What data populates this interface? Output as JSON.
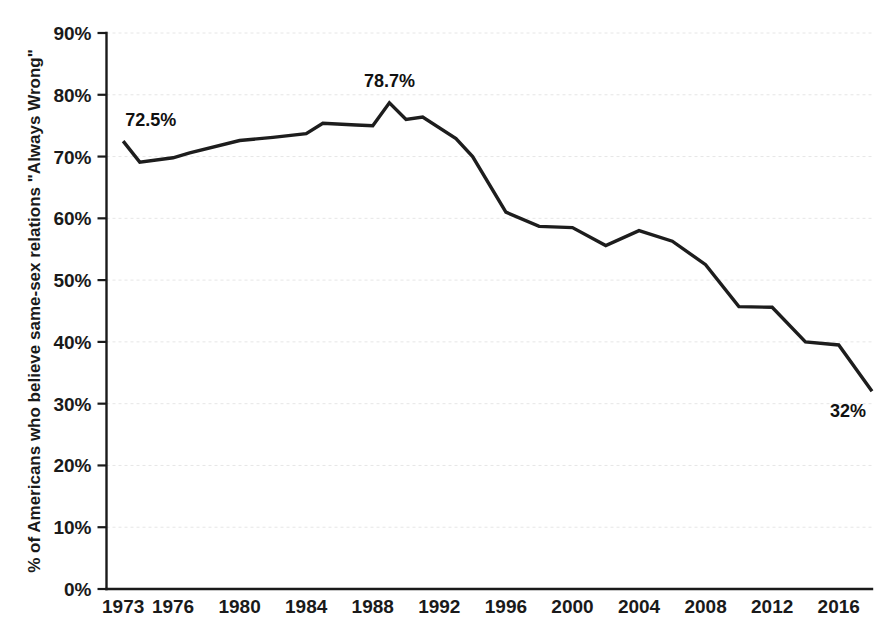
{
  "chart_data": {
    "type": "line",
    "title": "",
    "subtitle": "",
    "xlabel": "",
    "ylabel": "% of Americans who believe same-sex relations \"Always Wrong\"",
    "xlim": [
      1972,
      2018
    ],
    "ylim": [
      0,
      90
    ],
    "grid": true,
    "legend": "none",
    "y_tick_labels": [
      "0%",
      "10%",
      "20%",
      "30%",
      "40%",
      "50%",
      "60%",
      "70%",
      "80%",
      "90%"
    ],
    "y_tick_values": [
      0,
      10,
      20,
      30,
      40,
      50,
      60,
      70,
      80,
      90
    ],
    "x_tick_labels": [
      "1973",
      "1976",
      "1980",
      "1984",
      "1988",
      "1992",
      "1996",
      "2000",
      "2004",
      "2008",
      "2012",
      "2016"
    ],
    "x_tick_values": [
      1973,
      1976,
      1980,
      1984,
      1988,
      1992,
      1996,
      2000,
      2004,
      2008,
      2012,
      2016
    ],
    "series": [
      {
        "name": "Always Wrong",
        "color": "#1d1d1d",
        "x": [
          1973,
          1974,
          1976,
          1977,
          1980,
          1982,
          1984,
          1985,
          1987,
          1988,
          1989,
          1990,
          1991,
          1993,
          1994,
          1996,
          1998,
          2000,
          2002,
          2004,
          2006,
          2008,
          2010,
          2012,
          2014,
          2016,
          2018
        ],
        "y": [
          72.5,
          69.1,
          69.8,
          70.6,
          72.6,
          73.1,
          73.7,
          75.4,
          75.1,
          75.0,
          78.7,
          76.0,
          76.4,
          72.9,
          70.0,
          61.0,
          58.7,
          58.5,
          55.6,
          58.0,
          56.3,
          52.5,
          45.7,
          45.6,
          40.0,
          39.5,
          32.0
        ]
      }
    ],
    "annotations": [
      {
        "label": "72.5%",
        "x": 1973,
        "y": 72.5,
        "position": "above-right"
      },
      {
        "label": "78.7%",
        "x": 1989,
        "y": 78.7,
        "position": "above"
      },
      {
        "label": "32%",
        "x": 2018,
        "y": 32.0,
        "position": "below-left"
      }
    ]
  }
}
